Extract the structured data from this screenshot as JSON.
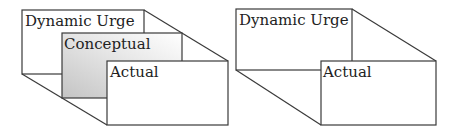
{
  "diagrams": [
    {
      "name": "three-layer",
      "layers": [
        {
          "label": "Dynamic Urge",
          "x": 22,
          "y": 10,
          "w": 122,
          "h": 64,
          "fill": "#ffffff"
        },
        {
          "label": "Conceptual",
          "x": 62,
          "y": 33,
          "w": 120,
          "h": 65,
          "fill": "gradient-grey"
        },
        {
          "label": "Actual",
          "x": 107,
          "y": 61,
          "w": 121,
          "h": 64,
          "fill": "#ffffff"
        }
      ]
    },
    {
      "name": "two-layer",
      "layers": [
        {
          "label": "Dynamic Urge",
          "x": 236,
          "y": 9,
          "w": 116,
          "h": 61,
          "fill": "#ffffff"
        },
        {
          "label": "Actual",
          "x": 321,
          "y": 61,
          "w": 115,
          "h": 64,
          "fill": "#ffffff"
        }
      ]
    }
  ],
  "colors": {
    "stroke": "#3a3a3a",
    "gradient_dark": "#c4c4c4",
    "gradient_light": "#ffffff"
  }
}
